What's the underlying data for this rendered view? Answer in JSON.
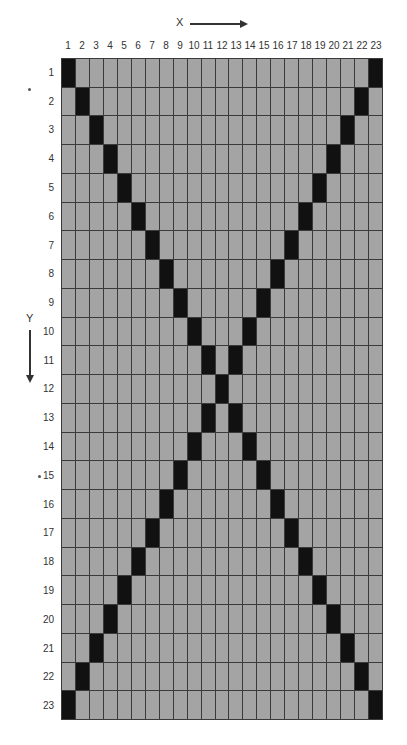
{
  "diagram": {
    "x_axis": {
      "label": "X",
      "direction": "right"
    },
    "y_axis": {
      "label": "Y",
      "direction": "down"
    },
    "columns": [
      "1",
      "2",
      "3",
      "4",
      "5",
      "6",
      "7",
      "8",
      "9",
      "10",
      "11",
      "12",
      "13",
      "14",
      "15",
      "16",
      "17",
      "18",
      "19",
      "20",
      "21",
      "22",
      "23"
    ],
    "rows": [
      "1",
      "2",
      "3",
      "4",
      "5",
      "6",
      "7",
      "8",
      "9",
      "10",
      "11",
      "12",
      "13",
      "14",
      "15",
      "16",
      "17",
      "18",
      "19",
      "20",
      "21",
      "22",
      "23"
    ],
    "grid_size": 23,
    "pattern": "X",
    "filled_rule": "cell (row r, col c) filled when c == r or c == 24 - r",
    "colors": {
      "cell": "#a4a4a4",
      "filled": "#111111",
      "grid_line": "#3a3a3a"
    }
  }
}
